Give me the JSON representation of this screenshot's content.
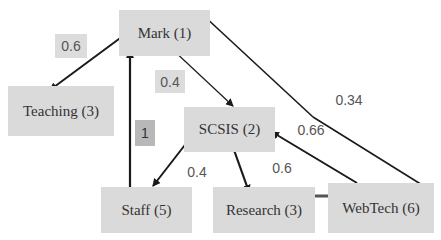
{
  "diagram": {
    "nodes": [
      {
        "id": "mark",
        "label": "Mark (1)"
      },
      {
        "id": "teaching",
        "label": "Teaching (3)"
      },
      {
        "id": "scsis",
        "label": "SCSIS (2)"
      },
      {
        "id": "staff",
        "label": "Staff (5)"
      },
      {
        "id": "research",
        "label": "Research (3)"
      },
      {
        "id": "webtech",
        "label": "WebTech (6)"
      }
    ],
    "edges": [
      {
        "from": "mark",
        "to": "teaching",
        "label": "0.6"
      },
      {
        "from": "mark",
        "to": "scsis",
        "label": "0.4"
      },
      {
        "from": "staff",
        "to": "mark",
        "label": "1"
      },
      {
        "from": "scsis",
        "to": "staff",
        "label": "0.4"
      },
      {
        "from": "scsis",
        "to": "research",
        "label": "0.6"
      },
      {
        "from": "webtech",
        "to": "scsis",
        "label": "0.66"
      },
      {
        "from": "webtech",
        "to": "mark",
        "label": "0.34"
      },
      {
        "from": "research",
        "to": "webtech",
        "label": ""
      }
    ]
  },
  "colors": {
    "node_bg": "#dadada",
    "edge": "#1a1a1a",
    "label_highlight": "#b8b8b8"
  }
}
